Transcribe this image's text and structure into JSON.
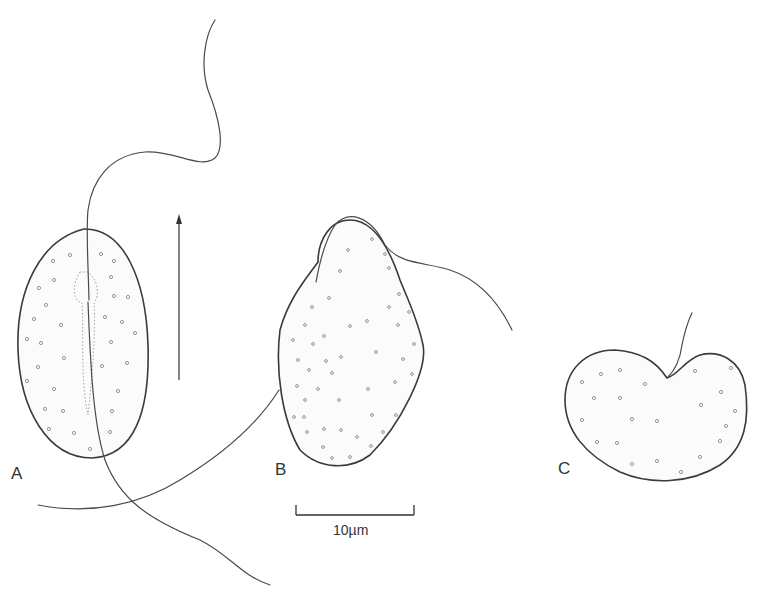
{
  "figure": {
    "panels": [
      {
        "id": "A",
        "label": "A",
        "description": "Elongate ovoid cell, ventral view, with longitudinal groove and two flagella"
      },
      {
        "id": "B",
        "label": "B",
        "description": "Pear-shaped cell, lateral view, with anterior and trailing flagella"
      },
      {
        "id": "C",
        "label": "C",
        "description": "Kidney/heart-shaped cell with single short flagellum"
      }
    ],
    "direction_arrow": {
      "meaning": "direction of movement",
      "orientation": "up"
    },
    "scale_bar": {
      "label": "10µm",
      "value": 10,
      "unit": "µm"
    },
    "colors": {
      "line": "#3a3a3a",
      "background": "#ffffff",
      "stipple": "#8a8a8a"
    }
  }
}
